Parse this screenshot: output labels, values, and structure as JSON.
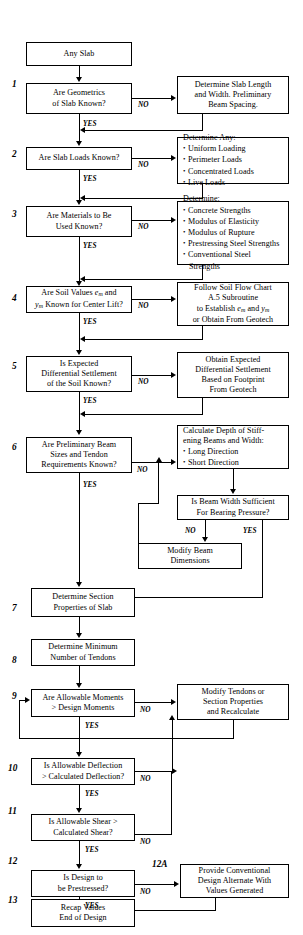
{
  "document": {
    "type": "engineering-flowchart",
    "header_faint_text": "",
    "title": "Post-Tensioned Slab Design Flow Chart"
  },
  "nodes": {
    "start": {
      "label": "Any Slab"
    },
    "step1": {
      "number": "1",
      "label": "Are Geometrics\nof Slab Known?"
    },
    "step1_no": {
      "label": "Determine Slab Length\nand Width.  Preliminary\nBeam Spacing."
    },
    "step2": {
      "number": "2",
      "label": "Are Slab Loads Known?"
    },
    "step2_no": {
      "title": "Determine Any:",
      "items": [
        "Uniform Loading",
        "Perimeter Loads",
        "Concentrated Loads",
        "Live Loads"
      ]
    },
    "step3": {
      "number": "3",
      "label": "Are Materials to Be\nUsed Known?"
    },
    "step3_no": {
      "title": "Determine:",
      "items": [
        "Concrete Strengths",
        "Modulus of Elasticity",
        "Modulus of Rupture",
        "Prestressing Steel Strengths",
        "Conventional Steel",
        "Strengths"
      ]
    },
    "step4": {
      "number": "4",
      "line1_a": "Are Soil Values ",
      "line1_sub": "m",
      "line1_b": " and",
      "line2_sub": "m",
      "line2_b": " Known for Center Lift?"
    },
    "step4_no": {
      "line1": "Follow Soil Flow Chart",
      "line2": "A.5 Subroutine",
      "line3_a": "to Establish ",
      "line3_b": " and "
    },
    "step5": {
      "number": "5",
      "label": "Is Expected\nDifferential Settlement\nof the Soil Known?"
    },
    "step5_no": {
      "label": "Obtain Expected\nDifferential Settlement\nBased on Footprint\nFrom Geotech"
    },
    "step6": {
      "number": "6",
      "label": "Are Preliminary Beam\nSizes and Tendon\nRequirements Known?"
    },
    "step6_no": {
      "title": "Calculate Depth of Stiff-\nening Beams and Width:",
      "items": [
        "Long Direction",
        "Short Direction"
      ]
    },
    "step6b": {
      "label": "Is Beam Width Sufficient\nFor Bearing Pressure?"
    },
    "step6c": {
      "label": "Modify Beam\nDimensions"
    },
    "step7": {
      "number": "7",
      "label": "Determine Section\nProperties of Slab"
    },
    "step8": {
      "number": "8",
      "label": "Determine Minimum\nNumber of Tendons"
    },
    "step9": {
      "number": "9",
      "label": "Are Allowable Moments\n> Design Moments"
    },
    "step9_no": {
      "label": "Modify Tendons or\nSection Properties\nand Recalculate"
    },
    "step10": {
      "number": "10",
      "label": "Is Allowable Deflection\n> Calculated Deflection?"
    },
    "step11": {
      "number": "11",
      "label": "Is Allowable Shear >\nCalculated Shear?"
    },
    "step12": {
      "number": "12",
      "label": "Is Design to\nbe Prestressed?"
    },
    "step12a": {
      "number": "12A",
      "label": "Provide Conventional\nDesign Alternate With\nValues Generated"
    },
    "step13": {
      "number": "13",
      "label": "Recap Values\nEnd of Design"
    }
  },
  "edge_labels": {
    "no": "NO",
    "yes": "YES"
  },
  "symbols": {
    "e": "e",
    "y": "y",
    "sub_m": "m"
  },
  "colors": {
    "stroke": "#000000",
    "background": "#ffffff"
  }
}
